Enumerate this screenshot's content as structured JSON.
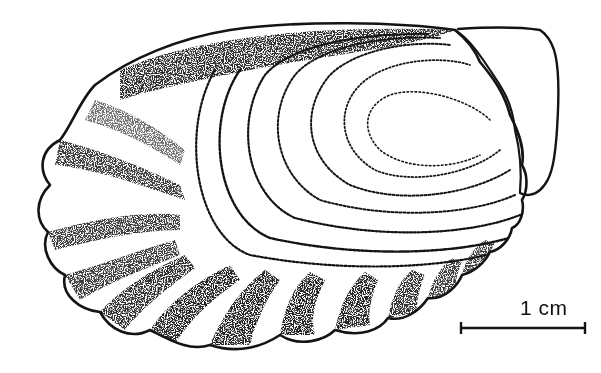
{
  "figure": {
    "ink_color": "#141414",
    "background_color": "#ffffff"
  },
  "scale_bar": {
    "label": "1 cm",
    "value": 1,
    "unit": "cm"
  }
}
